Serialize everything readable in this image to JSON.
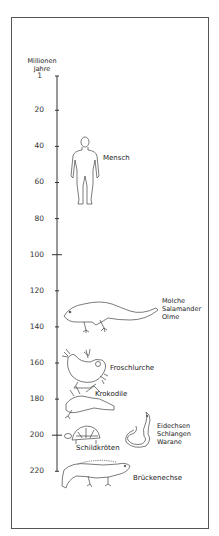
{
  "title_line1": "Millionen",
  "title_line2": "Jahre",
  "axis": {
    "label": "Millionen Jahre",
    "min": 1,
    "max": 220,
    "ticks": [
      {
        "value": 1,
        "label": "1"
      },
      {
        "value": 20,
        "label": "20"
      },
      {
        "value": 40,
        "label": "40"
      },
      {
        "value": 60,
        "label": "60"
      },
      {
        "value": 80,
        "label": "80"
      },
      {
        "value": 100,
        "label": "100"
      },
      {
        "value": 120,
        "label": "120"
      },
      {
        "value": 140,
        "label": "140"
      },
      {
        "value": 160,
        "label": "160"
      },
      {
        "value": 180,
        "label": "180"
      },
      {
        "value": 200,
        "label": "200"
      },
      {
        "value": 220,
        "label": "220"
      }
    ]
  },
  "groups": [
    {
      "name": "human",
      "label": "Mensch",
      "icon": "human-figure-icon",
      "age_mya": 50
    },
    {
      "name": "salamanders",
      "label_lines": [
        "Molche",
        "Salamander",
        "Olme"
      ],
      "icon": "salamander-icon",
      "age_mya": 130
    },
    {
      "name": "frogs",
      "label": "Froschlurche",
      "icon": "frog-icon",
      "age_mya": 160
    },
    {
      "name": "crocodiles",
      "label": "Krokodile",
      "icon": "crocodile-icon",
      "age_mya": 180
    },
    {
      "name": "lizards-snakes",
      "label_lines": [
        "Eidechsen",
        "Schlangen",
        "Warane"
      ],
      "icon": "snake-icon",
      "age_mya": 195
    },
    {
      "name": "turtles",
      "label": "Schildkröten",
      "icon": "turtle-icon",
      "age_mya": 200
    },
    {
      "name": "tuatara",
      "label": "Brückenechse",
      "icon": "tuatara-icon",
      "age_mya": 225
    }
  ]
}
